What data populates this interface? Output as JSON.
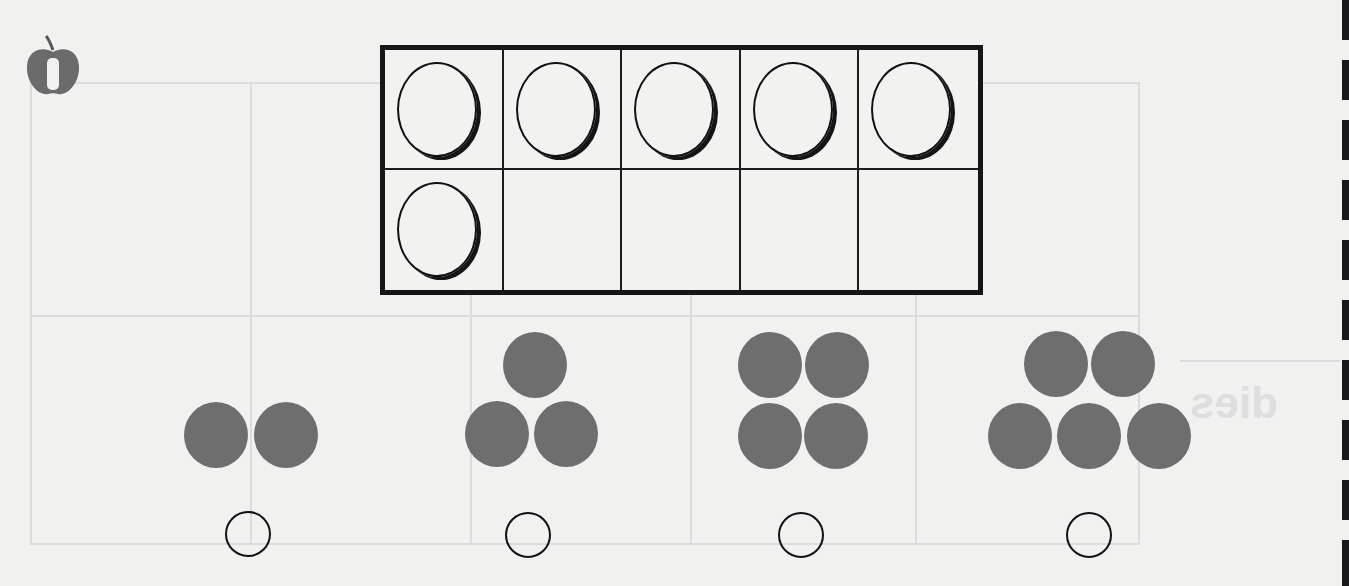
{
  "worksheet": {
    "lesson_badge": {
      "icon": "apple-icon",
      "number": "1"
    },
    "ten_frame": {
      "rows": 2,
      "columns": 5,
      "filled_count": 6,
      "cells": [
        {
          "filled": true
        },
        {
          "filled": true
        },
        {
          "filled": true
        },
        {
          "filled": true
        },
        {
          "filled": true
        },
        {
          "filled": true
        },
        {
          "filled": false
        },
        {
          "filled": false
        },
        {
          "filled": false
        },
        {
          "filled": false
        }
      ]
    },
    "dot_groups": [
      {
        "count": 2,
        "answer": ""
      },
      {
        "count": 3,
        "answer": ""
      },
      {
        "count": 4,
        "answer": ""
      },
      {
        "count": 5,
        "answer": ""
      }
    ],
    "colors": {
      "paper": "#f1f1f0",
      "dot_fill": "#6e6e6e",
      "outline": "#111111"
    }
  }
}
